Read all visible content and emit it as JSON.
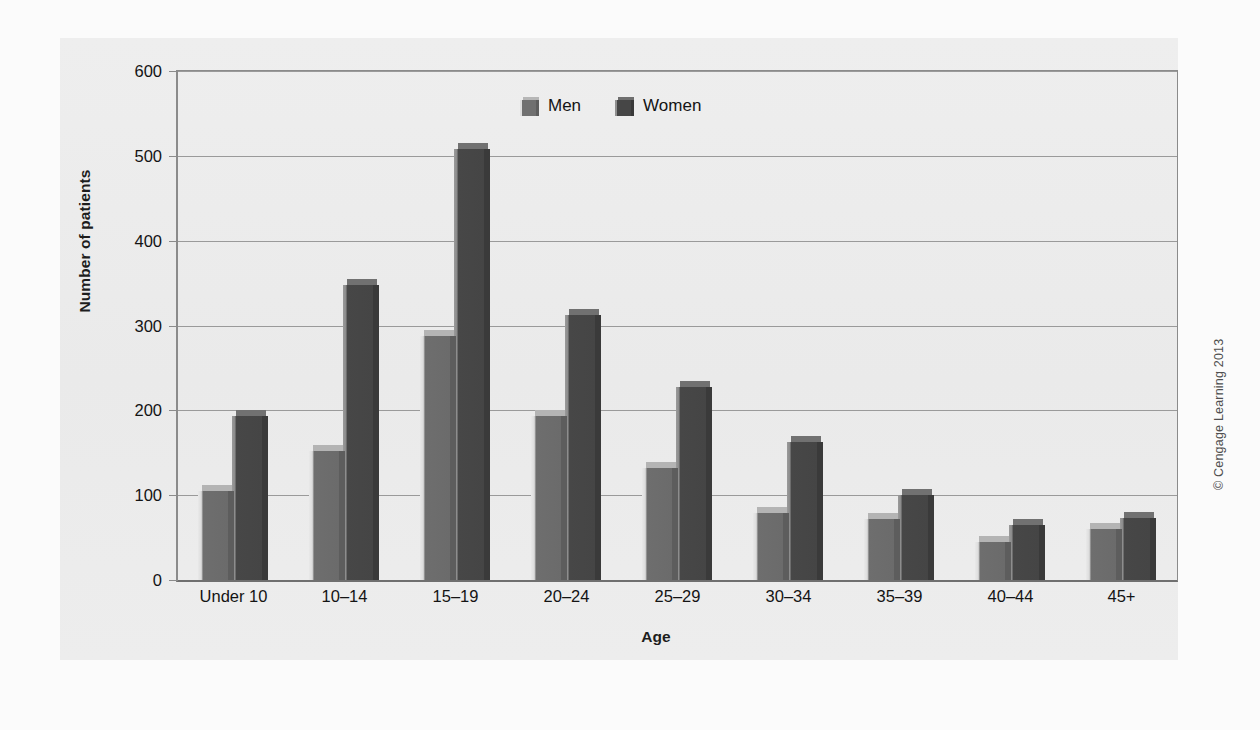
{
  "chart_data": {
    "type": "bar",
    "title": "",
    "subtitle": "",
    "xlabel": "Age",
    "ylabel": "Number of patients",
    "categories": [
      "Under 10",
      "10–14",
      "15–19",
      "20–24",
      "25–29",
      "30–34",
      "35–39",
      "40–44",
      "45+"
    ],
    "series": [
      {
        "name": "Men",
        "color": "#6e6e6e",
        "values": [
          105,
          152,
          288,
          193,
          132,
          79,
          72,
          45,
          60
        ]
      },
      {
        "name": "Women",
        "color": "#474747",
        "values": [
          193,
          348,
          508,
          312,
          228,
          163,
          100,
          65,
          73
        ]
      }
    ],
    "ylim": [
      0,
      600
    ],
    "yticks": [
      0,
      100,
      200,
      300,
      400,
      500,
      600
    ],
    "ytick_labels": [
      "0",
      "100",
      "200",
      "300",
      "400",
      "500",
      "600"
    ],
    "grid": true,
    "grid_axis": "y",
    "legend_position": "top-center",
    "bar_style": "3d-extruded",
    "plot_background": "#ececec"
  },
  "legend": {
    "items": [
      {
        "label": "Men"
      },
      {
        "label": "Women"
      }
    ]
  },
  "credit": {
    "text": "© Cengage Learning 2013"
  }
}
